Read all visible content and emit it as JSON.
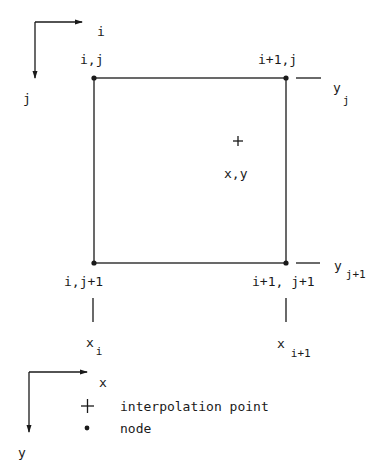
{
  "diagram": {
    "index_axes": {
      "horizontal_label": "i",
      "vertical_label": "j"
    },
    "nodes": [
      {
        "label": "i,j"
      },
      {
        "label": "i+1,j"
      },
      {
        "label": "i,j+1"
      },
      {
        "label": "i+1, j+1"
      }
    ],
    "interpolation_point": {
      "symbol": "+",
      "label": "x,y"
    },
    "y_ticks": [
      {
        "base": "y",
        "sub": "j"
      },
      {
        "base": "y",
        "sub": "j+1"
      }
    ],
    "x_ticks": [
      {
        "base": "x",
        "sub": "i"
      },
      {
        "base": "x",
        "sub": "i+1"
      }
    ],
    "coord_axes": {
      "horizontal_label": "x",
      "vertical_label": "y"
    },
    "legend": [
      {
        "symbol": "+",
        "label": "interpolation point"
      },
      {
        "symbol": "•",
        "label": "node"
      }
    ]
  }
}
